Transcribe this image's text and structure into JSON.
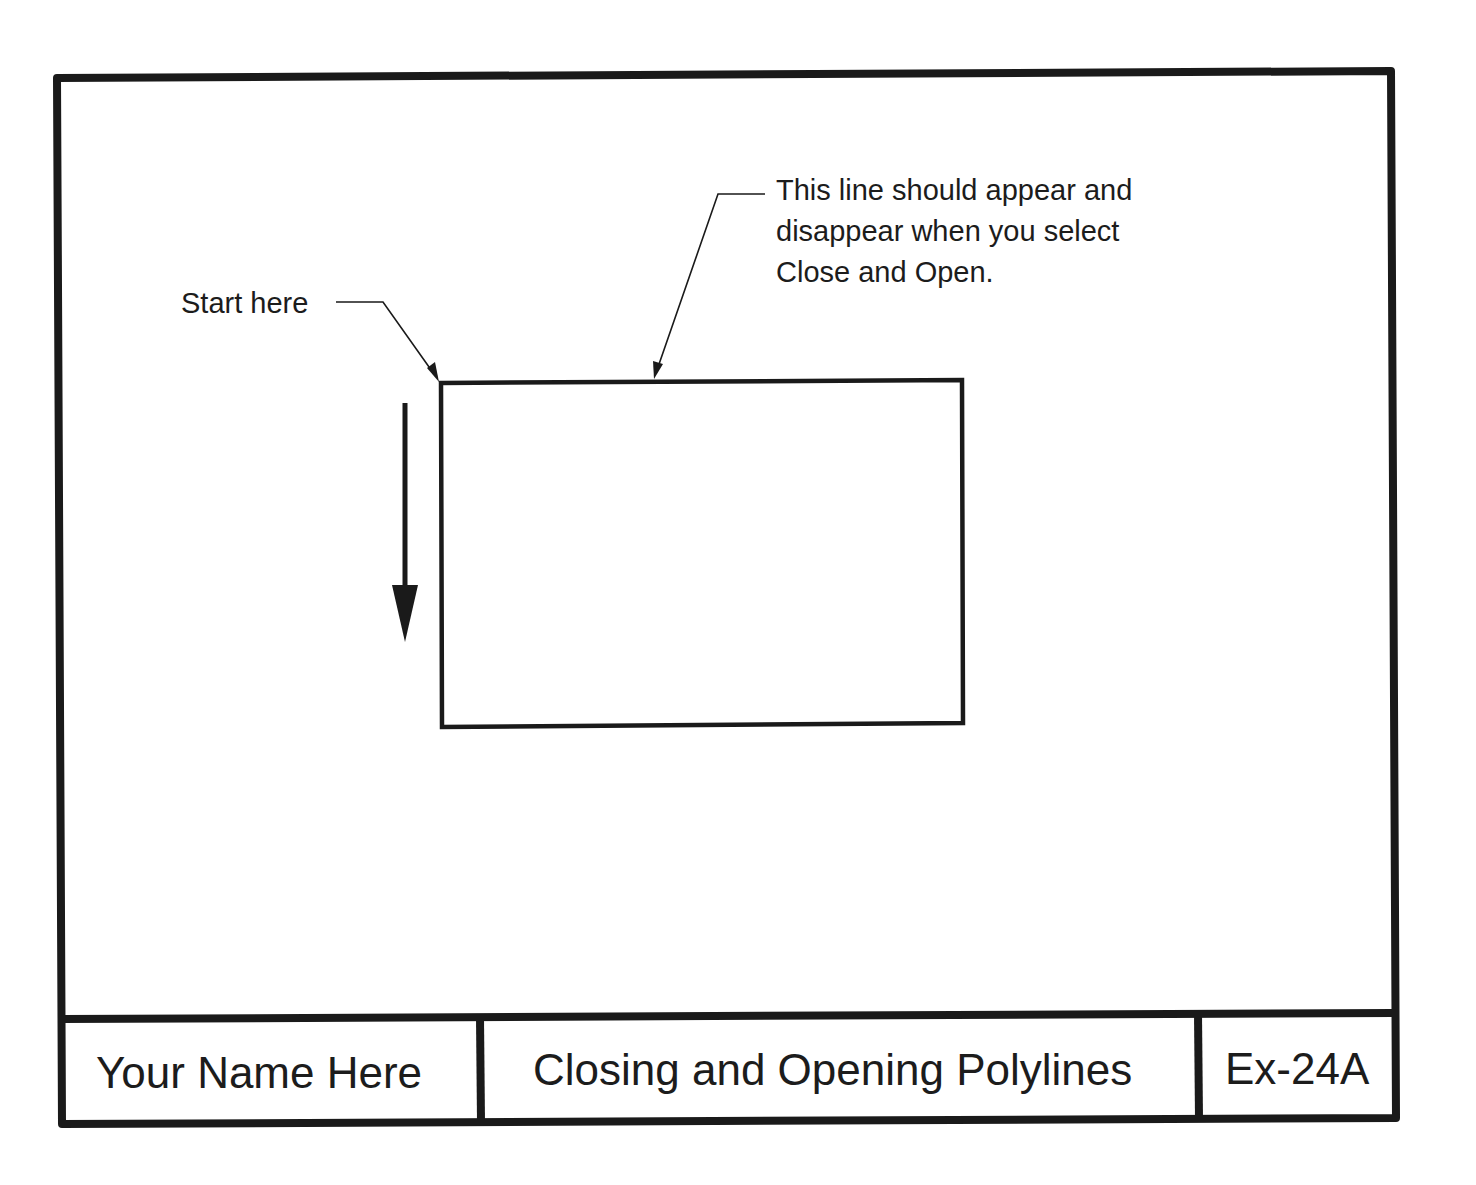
{
  "drawing": {
    "annotations": {
      "start_label": "Start here",
      "closing_segment_note": {
        "lines": [
          "This line should appear and",
          "disappear when you select",
          "Close and Open."
        ]
      }
    },
    "direction_arrow": {
      "direction": "down",
      "icon": "arrow-down-icon"
    },
    "shape": {
      "type": "rectangle-polyline"
    }
  },
  "title_block": {
    "name": "Your Name Here",
    "title": "Closing and Opening Polylines",
    "exercise_number": "Ex-24A"
  },
  "colors": {
    "line": "#1a1a1a",
    "background": "#ffffff"
  }
}
